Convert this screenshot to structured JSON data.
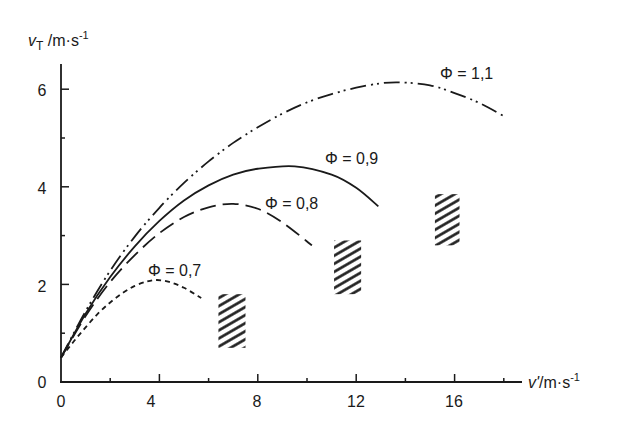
{
  "chart_data": {
    "type": "line",
    "title": "",
    "xlabel": "v'/m·s⁻¹",
    "ylabel": "v_T /m·s⁻¹",
    "xlabel_parts": {
      "symbol": "v'",
      "unit": "/m·s",
      "exp": "-1"
    },
    "ylabel_parts": {
      "symbol": "v",
      "sub": "T",
      "unit": " /m·s",
      "exp": "-1"
    },
    "xlim": [
      0,
      18.5
    ],
    "ylim": [
      0,
      6.5
    ],
    "x_ticks_major": [
      0,
      4,
      8,
      12,
      16
    ],
    "x_ticks_minor": [
      2,
      6,
      10,
      14,
      18
    ],
    "y_ticks_major": [
      0,
      2,
      4,
      6
    ],
    "y_ticks_minor": [
      1,
      3,
      5
    ],
    "grid": false,
    "legend": "inline labels",
    "series": [
      {
        "name": "Φ = 0,7",
        "style": "short-dash",
        "x": [
          0,
          0.5,
          1,
          1.5,
          2,
          2.5,
          3,
          3.5,
          3.9,
          4.4,
          5.0,
          5.7
        ],
        "y": [
          0.5,
          0.82,
          1.12,
          1.4,
          1.63,
          1.82,
          1.97,
          2.06,
          2.09,
          2.05,
          1.93,
          1.72
        ]
      },
      {
        "name": "Φ = 0,8",
        "style": "long-dash",
        "x": [
          0,
          1,
          2,
          3,
          4,
          5,
          6,
          7,
          8,
          9,
          10.2
        ],
        "y": [
          0.5,
          1.35,
          2.05,
          2.6,
          3.05,
          3.38,
          3.58,
          3.65,
          3.55,
          3.27,
          2.8
        ]
      },
      {
        "name": "Φ = 0,9",
        "style": "solid",
        "x": [
          0,
          1,
          2,
          3,
          4,
          5,
          6,
          7,
          8,
          9.5,
          11,
          12,
          12.9
        ],
        "y": [
          0.5,
          1.4,
          2.15,
          2.78,
          3.3,
          3.72,
          4.03,
          4.25,
          4.37,
          4.42,
          4.25,
          3.98,
          3.6
        ]
      },
      {
        "name": "Φ = 1,1",
        "style": "dash-dot-dot",
        "x": [
          0,
          1,
          2,
          3,
          4,
          5,
          6,
          7,
          8,
          9,
          10,
          11,
          12,
          13,
          13.8,
          15,
          16,
          17,
          18
        ],
        "y": [
          0.5,
          1.45,
          2.28,
          2.98,
          3.57,
          4.08,
          4.52,
          4.9,
          5.22,
          5.5,
          5.73,
          5.9,
          6.03,
          6.12,
          6.14,
          6.08,
          5.92,
          5.72,
          5.45
        ]
      }
    ],
    "hatched_regions": [
      {
        "x": [
          6.4,
          7.5
        ],
        "y": [
          0.7,
          1.8
        ],
        "near_series": "Φ = 0,7"
      },
      {
        "x": [
          11.1,
          12.2
        ],
        "y": [
          1.8,
          2.9
        ],
        "near_series": "Φ = 0,8"
      },
      {
        "x": [
          15.2,
          16.2
        ],
        "y": [
          2.8,
          3.85
        ],
        "near_series": "Φ = 0,9"
      }
    ],
    "annotations": [
      {
        "text": "Φ = 0,7",
        "x": 3.5,
        "y": 2.3
      },
      {
        "text": "Φ = 0,8",
        "x": 8.5,
        "y": 3.8
      },
      {
        "text": "Φ = 0,9",
        "x": 10.8,
        "y": 4.6
      },
      {
        "text": "Φ = 1,1",
        "x": 15.5,
        "y": 6.3
      }
    ]
  },
  "labels": {
    "y_axis_symbol": "v",
    "y_axis_sub": "T",
    "y_axis_unit": " /m·s",
    "y_axis_exp": "-1",
    "x_axis_symbol": "v'",
    "x_axis_unit": "/m·s",
    "x_axis_exp": "-1",
    "phi_07": "Φ = 0,7",
    "phi_08": "Φ = 0,8",
    "phi_09": "Φ = 0,9",
    "phi_11": "Φ = 1,1",
    "x0": "0",
    "x4": "4",
    "x8": "8",
    "x12": "12",
    "x16": "16",
    "y0": "0",
    "y2": "2",
    "y4": "4",
    "y6": "6"
  }
}
